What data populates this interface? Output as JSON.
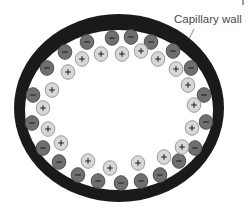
{
  "diagram": {
    "label": "Capillary wall",
    "colors": {
      "wall": "#1a1a1a",
      "negative_fill": "#6f6f6f",
      "negative_stroke": "#505050",
      "positive_fill": "#d8d8d8",
      "positive_stroke": "#9a9a9a",
      "sign": "#1a1a1a",
      "label": "#4a4a4a"
    },
    "wall": {
      "cx": 119,
      "cy": 108,
      "rx_outer": 105,
      "ry_outer": 94,
      "rx_inner": 94,
      "ry_inner": 80
    },
    "ions": [
      {
        "sign": "-",
        "x": 112,
        "y": 38
      },
      {
        "sign": "-",
        "x": 87,
        "y": 42
      },
      {
        "sign": "-",
        "x": 65,
        "y": 52
      },
      {
        "sign": "-",
        "x": 47,
        "y": 68
      },
      {
        "sign": "-",
        "x": 131,
        "y": 37
      },
      {
        "sign": "-",
        "x": 151,
        "y": 42
      },
      {
        "sign": "-",
        "x": 173,
        "y": 51
      },
      {
        "sign": "-",
        "x": 191,
        "y": 68
      },
      {
        "sign": "-",
        "x": 33,
        "y": 95
      },
      {
        "sign": "-",
        "x": 32,
        "y": 123
      },
      {
        "sign": "-",
        "x": 43,
        "y": 148
      },
      {
        "sign": "-",
        "x": 59,
        "y": 162
      },
      {
        "sign": "-",
        "x": 78,
        "y": 175
      },
      {
        "sign": "-",
        "x": 98,
        "y": 181
      },
      {
        "sign": "-",
        "x": 121,
        "y": 183
      },
      {
        "sign": "-",
        "x": 141,
        "y": 181
      },
      {
        "sign": "-",
        "x": 160,
        "y": 175
      },
      {
        "sign": "-",
        "x": 179,
        "y": 161
      },
      {
        "sign": "-",
        "x": 195,
        "y": 148
      },
      {
        "sign": "-",
        "x": 206,
        "y": 122
      },
      {
        "sign": "-",
        "x": 204,
        "y": 95
      },
      {
        "sign": "+",
        "x": 122,
        "y": 54
      },
      {
        "sign": "+",
        "x": 101,
        "y": 54
      },
      {
        "sign": "+",
        "x": 82,
        "y": 59
      },
      {
        "sign": "+",
        "x": 68,
        "y": 72
      },
      {
        "sign": "+",
        "x": 141,
        "y": 51
      },
      {
        "sign": "+",
        "x": 158,
        "y": 59
      },
      {
        "sign": "+",
        "x": 176,
        "y": 69
      },
      {
        "sign": "+",
        "x": 188,
        "y": 85
      },
      {
        "sign": "+",
        "x": 52,
        "y": 90
      },
      {
        "sign": "+",
        "x": 43,
        "y": 108
      },
      {
        "sign": "+",
        "x": 48,
        "y": 129
      },
      {
        "sign": "+",
        "x": 61,
        "y": 143
      },
      {
        "sign": "+",
        "x": 88,
        "y": 161
      },
      {
        "sign": "+",
        "x": 110,
        "y": 168
      },
      {
        "sign": "+",
        "x": 138,
        "y": 163
      },
      {
        "sign": "+",
        "x": 164,
        "y": 157
      },
      {
        "sign": "+",
        "x": 182,
        "y": 147
      },
      {
        "sign": "+",
        "x": 192,
        "y": 128
      },
      {
        "sign": "+",
        "x": 194,
        "y": 105
      }
    ]
  }
}
